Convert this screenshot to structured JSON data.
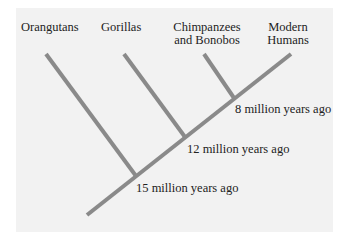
{
  "diagram": {
    "type": "phylogenetic-tree",
    "line_color": "#8a8a8a",
    "background_color": "#f2f2f2",
    "taxa": [
      {
        "id": "orangutans",
        "label": "Orangutans"
      },
      {
        "id": "gorillas",
        "label": "Gorillas"
      },
      {
        "id": "chimpanzees",
        "label_line1": "Chimpanzees",
        "label_line2": "and Bonobos"
      },
      {
        "id": "humans",
        "label_line1": "Modern",
        "label_line2": "Humans"
      }
    ],
    "divergences": [
      {
        "label": "15 million years ago"
      },
      {
        "label": "12 million years ago"
      },
      {
        "label": "8 million years ago"
      }
    ]
  }
}
